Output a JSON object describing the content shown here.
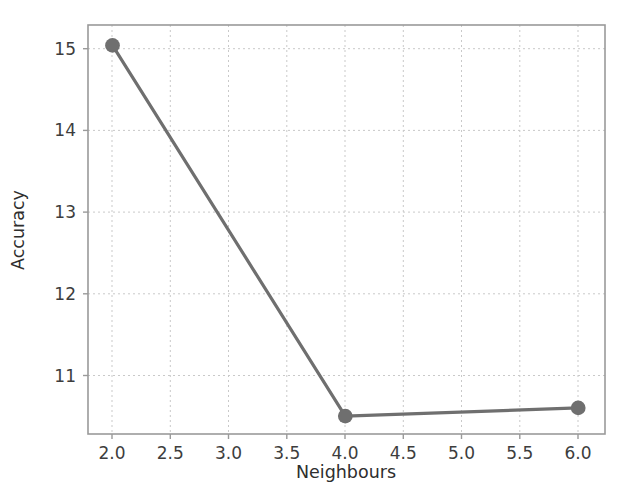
{
  "chart_data": {
    "type": "line",
    "title": "",
    "xlabel": "Neighbours",
    "ylabel": "Accuracy",
    "x": [
      2.0,
      4.0,
      6.0
    ],
    "values": [
      15.1,
      10.55,
      10.65
    ],
    "series": [
      {
        "name": "Accuracy",
        "x": [
          2.0,
          4.0,
          6.0
        ],
        "values": [
          15.1,
          10.55,
          10.65
        ]
      }
    ],
    "xlim": [
      1.79,
      6.23
    ],
    "ylim": [
      10.33,
      15.35
    ],
    "xticks": [
      2.0,
      2.5,
      3.0,
      3.5,
      4.0,
      4.5,
      5.0,
      5.5,
      6.0
    ],
    "xtick_labels": [
      "2.0",
      "2.5",
      "3.0",
      "3.5",
      "4.0",
      "4.5",
      "5.0",
      "5.5",
      "6.0"
    ],
    "yticks": [
      11,
      12,
      13,
      14,
      15
    ],
    "ytick_labels": [
      "11",
      "12",
      "13",
      "14",
      "15"
    ],
    "grid": true,
    "grid_style": "dashed",
    "legend": "none",
    "colors": {
      "line": "#6f6f6f",
      "marker": "#6f6f6f",
      "grid": "#c9c9c9",
      "spine": "#9a9a9a",
      "text": "#333333",
      "background": "#ffffff"
    },
    "line_width": 3.2,
    "marker_size": 9
  }
}
